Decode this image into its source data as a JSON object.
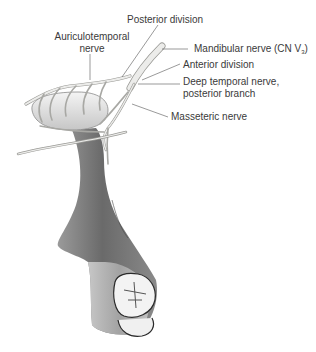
{
  "figure": {
    "labels": {
      "posterior_division": "Posterior division",
      "auriculotemporal_line1": "Auriculotemporal",
      "auriculotemporal_line2": "nerve",
      "mandibular_nerve": "Mandibular nerve (CN V",
      "mandibular_sub": "3",
      "mandibular_close": ")",
      "anterior_division": "Anterior division",
      "deep_temporal_line1": "Deep temporal nerve,",
      "deep_temporal_line2": "posterior branch",
      "masseteric_nerve": "Masseteric nerve"
    },
    "colors": {
      "text": "#3a3a3a",
      "leader_line": "#555555",
      "nerve": "#e8e8e4",
      "nerve_outline": "#9a9a96",
      "bone_dark": "#6e6e6e",
      "bone_light": "#b9b9b9",
      "condyle": "#d8d8d8",
      "tooth": "#f2f2f2"
    }
  }
}
